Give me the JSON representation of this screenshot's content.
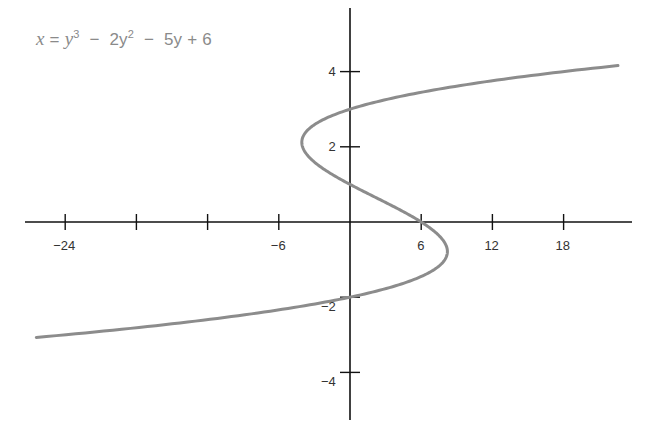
{
  "chart_data": {
    "type": "line",
    "equation": {
      "lhs": "x",
      "terms": [
        "y",
        "3",
        "2y",
        "2",
        "5y",
        "6"
      ],
      "display": "x = y³ − 2y² − 5y + 6"
    },
    "xlabel": "",
    "ylabel": "",
    "x_ticks": [
      -24,
      -18,
      -12,
      -6,
      6,
      12,
      18
    ],
    "x_tick_labels": [
      "−24",
      "",
      "",
      "−6",
      "6",
      "12",
      "18"
    ],
    "y_ticks": [
      4,
      2,
      -2,
      -4
    ],
    "y_tick_labels": [
      "4",
      "2",
      "−2",
      "−4"
    ],
    "xlim": [
      -27,
      24
    ],
    "ylim": [
      -5.5,
      5.5
    ],
    "grid": false,
    "legend": null,
    "curve": {
      "parametric_in": "y",
      "y_range": [
        -3.07,
        4.16
      ],
      "points": [
        {
          "y": -3.07,
          "x": -26.9
        },
        {
          "y": -2.5,
          "x": -13.6
        },
        {
          "y": -2.0,
          "x": 0
        },
        {
          "y": -1.5,
          "x": 5.63
        },
        {
          "y": -0.786,
          "x": 8.21
        },
        {
          "y": 0,
          "x": 6
        },
        {
          "y": 1,
          "x": 0
        },
        {
          "y": 2,
          "x": -4
        },
        {
          "y": 2.12,
          "x": -4.06
        },
        {
          "y": 3,
          "x": 0
        },
        {
          "y": 3.5,
          "x": 4.38
        },
        {
          "y": 4.16,
          "x": 22.6
        }
      ],
      "color": "#8c8c8c"
    },
    "axis_color": "#111111"
  }
}
